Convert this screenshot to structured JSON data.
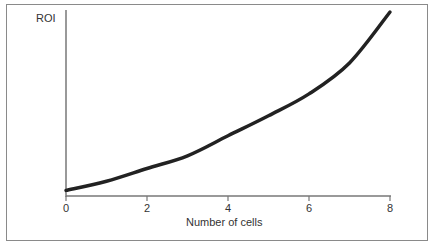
{
  "chart_data": {
    "type": "line",
    "title": "",
    "xlabel": "Number of cells",
    "ylabel": "ROI",
    "x_ticks": [
      0,
      2,
      4,
      6,
      8
    ],
    "y_ticks": [],
    "xlim": [
      0,
      8
    ],
    "ylim": [
      0,
      100
    ],
    "grid": false,
    "legend": null,
    "series": [
      {
        "name": "ROI",
        "x": [
          0,
          1,
          2,
          3,
          4,
          5,
          6,
          7,
          8
        ],
        "values": [
          2,
          7,
          14,
          21,
          32,
          43,
          55,
          72,
          100
        ]
      }
    ]
  },
  "labels": {
    "y_axis": "ROI",
    "x_axis": "Number of cells",
    "x_ticks": [
      "0",
      "2",
      "4",
      "6",
      "8"
    ]
  }
}
